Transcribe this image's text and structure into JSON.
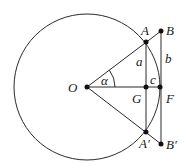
{
  "diagram": {
    "type": "geometry",
    "colors": {
      "stroke": "#2a2a2a",
      "point": "#111111",
      "text": "#1a1a1a",
      "background": "#ffffff"
    },
    "circle": {
      "center": "O",
      "cx": 87,
      "cy": 87,
      "r": 73
    },
    "points": {
      "O": {
        "label": "O",
        "x": 87,
        "y": 87
      },
      "A": {
        "label": "A",
        "x": 146,
        "y": 42
      },
      "B": {
        "label": "B",
        "x": 161,
        "y": 31
      },
      "G": {
        "label": "G",
        "x": 146,
        "y": 87
      },
      "F": {
        "label": "F",
        "x": 160,
        "y": 87
      },
      "A2": {
        "label": "A′",
        "x": 146,
        "y": 132
      },
      "B2": {
        "label": "B′",
        "x": 161,
        "y": 144
      }
    },
    "segment_labels": {
      "a": "a",
      "b": "b",
      "c": "c",
      "alpha": "α"
    }
  }
}
